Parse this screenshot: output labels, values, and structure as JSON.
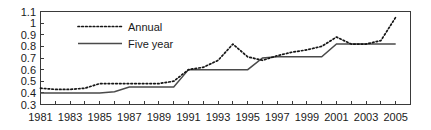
{
  "chart_data": {
    "type": "line",
    "title": "",
    "subtitle": "",
    "xlabel": "",
    "ylabel": "",
    "xlim": [
      1981,
      2006
    ],
    "ylim": [
      0.3,
      1.1
    ],
    "grid": false,
    "legend_position": "top-left-inside",
    "y_ticks": [
      "0.3",
      "0.4",
      "0.5",
      "0.6",
      "0.7",
      "0.8",
      "0.9",
      "1",
      "1.1"
    ],
    "y_tick_values": [
      0.3,
      0.4,
      0.5,
      0.6,
      0.7,
      0.8,
      0.9,
      1.0,
      1.1
    ],
    "x_ticks": [
      "1981",
      "1983",
      "1985",
      "1987",
      "1989",
      "1991",
      "1993",
      "1995",
      "1997",
      "1999",
      "2001",
      "2003",
      "2005"
    ],
    "x_tick_values": [
      1981,
      1983,
      1985,
      1987,
      1989,
      1991,
      1993,
      1995,
      1997,
      1999,
      2001,
      2003,
      2005
    ],
    "x_minor_tick_values": [
      1982,
      1984,
      1986,
      1988,
      1990,
      1992,
      1994,
      1996,
      1998,
      2000,
      2002,
      2004,
      2006
    ],
    "x": [
      1981,
      1982,
      1983,
      1984,
      1985,
      1986,
      1987,
      1988,
      1989,
      1990,
      1991,
      1992,
      1993,
      1994,
      1995,
      1996,
      1997,
      1998,
      1999,
      2000,
      2001,
      2002,
      2003,
      2004,
      2005
    ],
    "series": [
      {
        "name": "Annual",
        "style": "dotted",
        "color": "#151515",
        "values": [
          0.44,
          0.43,
          0.43,
          0.44,
          0.48,
          0.48,
          0.48,
          0.48,
          0.48,
          0.5,
          0.6,
          0.62,
          0.68,
          0.82,
          0.71,
          0.68,
          0.72,
          0.75,
          0.77,
          0.8,
          0.88,
          0.82,
          0.82,
          0.85,
          1.05
        ]
      },
      {
        "name": "Five year",
        "style": "solid",
        "color": "#4a4a4a",
        "values": [
          0.4,
          0.4,
          0.4,
          0.4,
          0.4,
          0.41,
          0.45,
          0.45,
          0.45,
          0.45,
          0.6,
          0.6,
          0.6,
          0.6,
          0.6,
          0.7,
          0.71,
          0.71,
          0.71,
          0.71,
          0.82,
          0.82,
          0.82,
          0.82,
          0.82
        ]
      }
    ]
  },
  "legend": {
    "items": [
      {
        "label": "Annual",
        "style": "dotted"
      },
      {
        "label": "Five year",
        "style": "solid"
      }
    ]
  }
}
